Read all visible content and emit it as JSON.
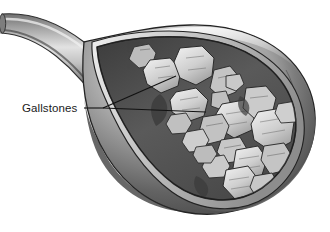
{
  "figure": {
    "title": "Gallstones",
    "background_color": "#ffffff",
    "style": "grayscale-medical-illustration"
  },
  "labels": [
    {
      "id": "gallstones",
      "text": "Gallstones",
      "x": 22,
      "y": 112,
      "color": "#1a1a1a",
      "leader": {
        "stem_start": [
          84,
          108
        ],
        "fork": [
          103,
          108
        ],
        "branch_upper_end": [
          176,
          76
        ],
        "branch_lower_end": [
          206,
          112
        ],
        "color": "#111111",
        "width": 1.1
      }
    }
  ],
  "anatomy": {
    "cystic_duct": {
      "name": "cystic-duct",
      "description": "tubular duct entering from upper left",
      "fill_light": "#e3e3e3",
      "fill_mid": "#9a9a9a",
      "fill_dark": "#4a4a4a"
    },
    "gallbladder_wall": {
      "name": "gallbladder-wall",
      "description": "pear shaped muscular sac cut open on upper face",
      "fill_light": "#efefef",
      "fill_mid": "#8f8f8f",
      "fill_dark": "#3b3b3b",
      "outline": "#2a2a2a"
    },
    "mucosa_rim": {
      "name": "mucosa-rim",
      "description": "light inner lining rim along the cut edge",
      "fill": "#d4d4d4"
    },
    "cavity": {
      "name": "gallbladder-cavity",
      "description": "dark interior lumen visible through the cut window",
      "fill_dark": "#4c4c4c",
      "fill_mid": "#5f5f5f"
    }
  },
  "colors": {
    "stone_light": "#d6d6d6",
    "stone_mid": "#bdbdbd",
    "stone_shadow": "#8e8e8e",
    "stone_outline": "#2e2e2e",
    "facet_line": "#6b6b6b",
    "ink": "#1a1a1a",
    "paper": "#ffffff"
  },
  "gallstones": {
    "count": 21,
    "description": "cluster of faceted polygonal calculi packed inside the lumen",
    "items": [
      {
        "id": 1,
        "cx": 142,
        "cy": 57,
        "r": 13,
        "rot": -18,
        "sides": 6,
        "tone": "#d2d2d2"
      },
      {
        "id": 2,
        "cx": 164,
        "cy": 76,
        "r": 17,
        "rot": 12,
        "sides": 7,
        "tone": "#cdcdcd"
      },
      {
        "id": 3,
        "cx": 196,
        "cy": 66,
        "r": 18,
        "rot": -8,
        "sides": 6,
        "tone": "#d8d8d8"
      },
      {
        "id": 4,
        "cx": 206,
        "cy": 86,
        "r": 15,
        "rot": 22,
        "sides": 7,
        "tone": "#c6c6c6"
      },
      {
        "id": 5,
        "cx": 190,
        "cy": 104,
        "r": 16,
        "rot": -14,
        "sides": 6,
        "tone": "#d0d0d0"
      },
      {
        "id": 6,
        "cx": 219,
        "cy": 100,
        "r": 9,
        "rot": 30,
        "sides": 5,
        "tone": "#bfbfbf"
      },
      {
        "id": 7,
        "cx": 233,
        "cy": 84,
        "r": 8,
        "rot": -25,
        "sides": 5,
        "tone": "#c9c9c9"
      },
      {
        "id": 8,
        "cx": 236,
        "cy": 118,
        "r": 17,
        "rot": 8,
        "sides": 7,
        "tone": "#d4d4d4"
      },
      {
        "id": 9,
        "cx": 258,
        "cy": 104,
        "r": 16,
        "rot": -20,
        "sides": 6,
        "tone": "#cbcbcb"
      },
      {
        "id": 10,
        "cx": 272,
        "cy": 130,
        "r": 19,
        "rot": 14,
        "sides": 7,
        "tone": "#d9d9d9"
      },
      {
        "id": 11,
        "cx": 214,
        "cy": 128,
        "r": 13,
        "rot": -30,
        "sides": 6,
        "tone": "#c2c2c2"
      },
      {
        "id": 12,
        "cx": 196,
        "cy": 140,
        "r": 11,
        "rot": 18,
        "sides": 5,
        "tone": "#cecece"
      },
      {
        "id": 13,
        "cx": 232,
        "cy": 148,
        "r": 12,
        "rot": -6,
        "sides": 6,
        "tone": "#c7c7c7"
      },
      {
        "id": 14,
        "cx": 250,
        "cy": 160,
        "r": 15,
        "rot": 26,
        "sides": 6,
        "tone": "#d3d3d3"
      },
      {
        "id": 15,
        "cx": 276,
        "cy": 158,
        "r": 14,
        "rot": -16,
        "sides": 7,
        "tone": "#c4c4c4"
      },
      {
        "id": 16,
        "cx": 216,
        "cy": 166,
        "r": 11,
        "rot": 10,
        "sides": 5,
        "tone": "#cacaca"
      },
      {
        "id": 17,
        "cx": 240,
        "cy": 178,
        "r": 16,
        "rot": -24,
        "sides": 6,
        "tone": "#dadada"
      },
      {
        "id": 18,
        "cx": 264,
        "cy": 184,
        "r": 12,
        "rot": 16,
        "sides": 6,
        "tone": "#c8c8c8"
      },
      {
        "id": 19,
        "cx": 180,
        "cy": 122,
        "r": 10,
        "rot": -12,
        "sides": 5,
        "tone": "#c0c0c0"
      },
      {
        "id": 20,
        "cx": 288,
        "cy": 112,
        "r": 11,
        "rot": 20,
        "sides": 5,
        "tone": "#cfcfcf"
      },
      {
        "id": 21,
        "cx": 204,
        "cy": 154,
        "r": 9,
        "rot": -28,
        "sides": 5,
        "tone": "#bcbcbc"
      }
    ]
  }
}
